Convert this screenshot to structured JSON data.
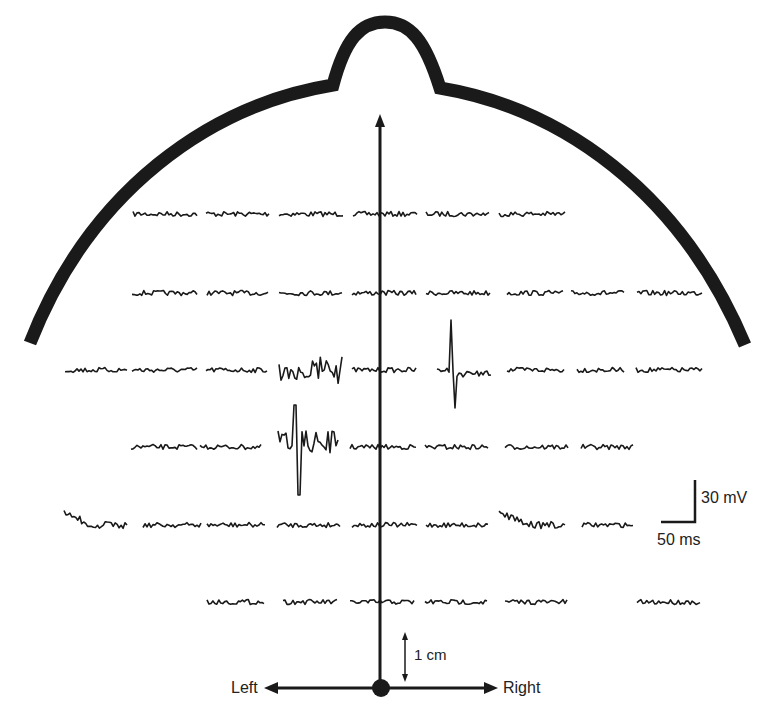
{
  "diagram": {
    "colors": {
      "ink": "#1a1a1a",
      "background": "#ffffff"
    },
    "axis": {
      "left_label": "Left",
      "right_label": "Right"
    },
    "scale_bar": {
      "voltage_label": "30 mV",
      "time_label": "50 ms"
    },
    "distance_bar": {
      "label": "1 cm"
    },
    "rows": [
      {
        "y": 214,
        "traces": [
          {
            "x": 133,
            "w": 64
          },
          {
            "x": 206,
            "w": 63
          },
          {
            "x": 279,
            "w": 64
          },
          {
            "x": 353,
            "w": 64
          },
          {
            "x": 426,
            "w": 63
          },
          {
            "x": 499,
            "w": 66
          }
        ]
      },
      {
        "y": 293,
        "traces": [
          {
            "x": 132,
            "w": 65
          },
          {
            "x": 207,
            "w": 61
          },
          {
            "x": 279,
            "w": 63
          },
          {
            "x": 352,
            "w": 64
          },
          {
            "x": 426,
            "w": 64
          },
          {
            "x": 507,
            "w": 56
          },
          {
            "x": 571,
            "w": 53
          },
          {
            "x": 637,
            "w": 65
          }
        ]
      },
      {
        "y": 370,
        "traces": [
          {
            "x": 65,
            "w": 62
          },
          {
            "x": 132,
            "w": 65
          },
          {
            "x": 206,
            "w": 61
          },
          {
            "x": 279,
            "w": 63,
            "type": "burst"
          },
          {
            "x": 352,
            "w": 64
          },
          {
            "x": 437,
            "w": 54,
            "type": "spike"
          },
          {
            "x": 507,
            "w": 57
          },
          {
            "x": 577,
            "w": 47
          },
          {
            "x": 636,
            "w": 66
          }
        ]
      },
      {
        "y": 447,
        "traces": [
          {
            "x": 131,
            "w": 66
          },
          {
            "x": 200,
            "w": 61
          },
          {
            "x": 278,
            "w": 60,
            "type": "big-burst"
          },
          {
            "x": 350,
            "w": 66
          },
          {
            "x": 425,
            "w": 63
          },
          {
            "x": 505,
            "w": 63
          },
          {
            "x": 581,
            "w": 52
          }
        ]
      },
      {
        "y": 525,
        "traces": [
          {
            "x": 64,
            "w": 63,
            "type": "drift"
          },
          {
            "x": 143,
            "w": 58
          },
          {
            "x": 207,
            "w": 58
          },
          {
            "x": 277,
            "w": 63
          },
          {
            "x": 352,
            "w": 65
          },
          {
            "x": 426,
            "w": 62
          },
          {
            "x": 499,
            "w": 66,
            "type": "drift"
          },
          {
            "x": 582,
            "w": 51
          }
        ]
      },
      {
        "y": 602,
        "traces": [
          {
            "x": 207,
            "w": 57
          },
          {
            "x": 283,
            "w": 54
          },
          {
            "x": 350,
            "w": 64
          },
          {
            "x": 425,
            "w": 62
          },
          {
            "x": 505,
            "w": 62
          },
          {
            "x": 637,
            "w": 63
          }
        ]
      }
    ]
  }
}
